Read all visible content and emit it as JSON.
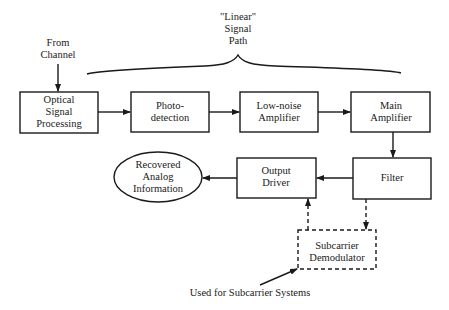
{
  "diagram": {
    "source_label": [
      "From",
      "Channel"
    ],
    "brace_label": [
      "\"Linear\"",
      "Signal",
      "Path"
    ],
    "blocks": [
      {
        "id": "optical",
        "lines": [
          "Optical",
          "Signal",
          "Processing"
        ],
        "style": "solid"
      },
      {
        "id": "photo",
        "lines": [
          "Photo-",
          "detection"
        ],
        "style": "solid"
      },
      {
        "id": "lna",
        "lines": [
          "Low-noise",
          "Amplifier"
        ],
        "style": "solid"
      },
      {
        "id": "main_amp",
        "lines": [
          "Main",
          "Amplifier"
        ],
        "style": "solid"
      },
      {
        "id": "filter",
        "lines": [
          "Filter"
        ],
        "style": "solid"
      },
      {
        "id": "output_driver",
        "lines": [
          "Output",
          "Driver"
        ],
        "style": "solid"
      },
      {
        "id": "subcarrier",
        "lines": [
          "Subcarrier",
          "Demodulator"
        ],
        "style": "dashed"
      }
    ],
    "terminal": {
      "id": "recovered",
      "lines": [
        "Recovered",
        "Analog",
        "Information"
      ],
      "shape": "ellipse"
    },
    "note": "Used for Subcarrier Systems",
    "edges": [
      {
        "from": "channel",
        "to": "optical",
        "style": "solid"
      },
      {
        "from": "optical",
        "to": "photo",
        "style": "solid"
      },
      {
        "from": "photo",
        "to": "lna",
        "style": "solid"
      },
      {
        "from": "lna",
        "to": "main_amp",
        "style": "solid"
      },
      {
        "from": "main_amp",
        "to": "filter",
        "style": "solid"
      },
      {
        "from": "filter",
        "to": "output_driver",
        "style": "solid"
      },
      {
        "from": "output_driver",
        "to": "recovered",
        "style": "solid"
      },
      {
        "from": "filter",
        "to": "subcarrier",
        "style": "dashed"
      },
      {
        "from": "subcarrier",
        "to": "output_driver",
        "style": "dashed"
      },
      {
        "from": "note",
        "to": "subcarrier",
        "style": "solid"
      }
    ],
    "colors": {
      "stroke": "#1a1a1a",
      "background": "#ffffff"
    }
  }
}
